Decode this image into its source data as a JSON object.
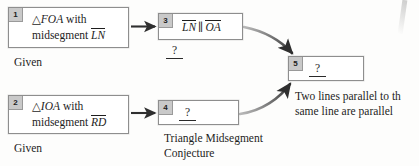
{
  "diagram": {
    "type": "flowchart-proof",
    "title_visible": false,
    "boxes": [
      {
        "id": "box-1",
        "number": "1",
        "line1_symbol": "△FOA",
        "line1_tail": " with",
        "line2_lead": "midsegment ",
        "line2_segment": "LN",
        "caption": "Given"
      },
      {
        "id": "box-2",
        "number": "2",
        "line1_symbol": "△IOA",
        "line1_tail": " with",
        "line2_lead": "midsegment ",
        "line2_segment": "RD",
        "caption": "Given"
      },
      {
        "id": "box-3",
        "number": "3",
        "segment_left": "LN",
        "parallel_symbol": "∥",
        "segment_right": "OA",
        "reason_placeholder": "?"
      },
      {
        "id": "box-4",
        "number": "4",
        "statement_placeholder": "?",
        "caption_line1": "Triangle Midsegment",
        "caption_line2": "Conjecture"
      },
      {
        "id": "box-5",
        "number": "5",
        "statement_placeholder": "?",
        "caption_line1": "Two lines parallel to th",
        "caption_line2": "same line are parallel"
      }
    ],
    "arrows": [
      {
        "id": "arrow-1-to-3",
        "style": "straight",
        "from": "box-1",
        "to": "box-3"
      },
      {
        "id": "arrow-2-to-4",
        "style": "straight",
        "from": "box-2",
        "to": "box-4"
      },
      {
        "id": "arrow-3-to-5",
        "style": "curved",
        "from": "box-3",
        "to": "box-5"
      },
      {
        "id": "arrow-4-to-5",
        "style": "curved",
        "from": "box-4",
        "to": "box-5"
      }
    ],
    "colors": {
      "box_border": "#8e8e8e",
      "badge_fill": "#c9c9c9",
      "text": "#1d1d1d",
      "arrow": "#3b3b3b",
      "page_background": "#fdfdfc"
    }
  }
}
